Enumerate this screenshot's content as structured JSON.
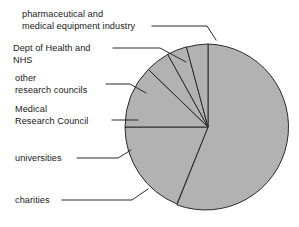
{
  "chart_data": {
    "type": "pie",
    "title": "",
    "subtitle": "",
    "xlabel": "",
    "ylabel": "",
    "grid": false,
    "legend_position": "none",
    "label_style": "external-leader-lines",
    "start_angle_deg": 0,
    "direction": "counterclockwise-from-top",
    "units": "percent",
    "categories": [
      "pharmaceutical and medical equipment industry",
      "Dept of Health and NHS",
      "other research councils",
      "Medical Research Council",
      "universities",
      "charities"
    ],
    "values": [
      56,
      4,
      4,
      5,
      12,
      19
    ],
    "slices": [
      {
        "label": "pharmaceutical and medical equipment industry",
        "value": 56,
        "start_angle_deg": 0,
        "end_angle_deg": 202,
        "sweep_deg": 202,
        "color": "#b2b2b2"
      },
      {
        "label": "charities",
        "value": 19,
        "start_angle_deg": 202,
        "end_angle_deg": 270,
        "sweep_deg": 68,
        "color": "#b2b2b2"
      },
      {
        "label": "universities",
        "value": 12,
        "start_angle_deg": 270,
        "end_angle_deg": 314,
        "sweep_deg": 44,
        "color": "#b2b2b2"
      },
      {
        "label": "Medical Research Council",
        "value": 5,
        "start_angle_deg": 314,
        "end_angle_deg": 331,
        "sweep_deg": 17,
        "color": "#b2b2b2"
      },
      {
        "label": "other research councils",
        "value": 4,
        "start_angle_deg": 331,
        "end_angle_deg": 345,
        "sweep_deg": 14,
        "color": "#b2b2b2"
      },
      {
        "label": "Dept of Health and NHS",
        "value": 4,
        "start_angle_deg": 345,
        "end_angle_deg": 360,
        "sweep_deg": 15,
        "color": "#b2b2b2"
      }
    ],
    "geometry": {
      "center_x": 208,
      "center_y": 127,
      "radius": 83
    },
    "colors": {
      "slice_fill": "#b2b2b2",
      "slice_stroke": "#2b2b2b",
      "leader_line": "#2b2b2b",
      "label_text": "#1a1a1a",
      "background": "#ffffff"
    }
  },
  "labels": {
    "pharma": {
      "line1": "pharmaceutical and",
      "line2": "medical equipment industry"
    },
    "doh": {
      "line1": "Dept of Health and",
      "line2": "NHS"
    },
    "other_councils": {
      "line1": "other",
      "line2": "research councils"
    },
    "mrc": {
      "line1": "Medical",
      "line2": "Research Council"
    },
    "universities": {
      "line1": "universities"
    },
    "charities": {
      "line1": "charities"
    }
  }
}
